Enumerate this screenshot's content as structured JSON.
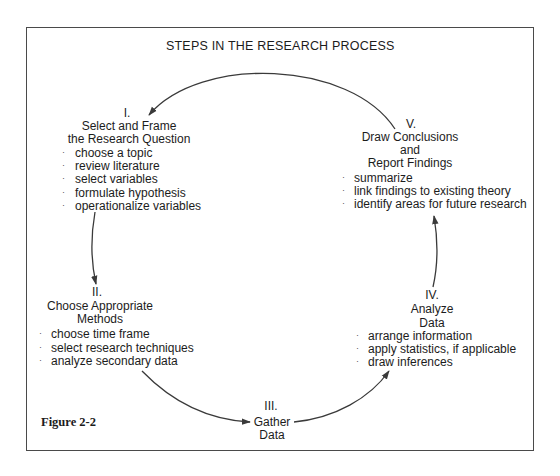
{
  "title": "STEPS IN THE RESEARCH PROCESS",
  "figure_label": "Figure 2-2",
  "bullet_glyph": "·",
  "steps": [
    {
      "numeral": "I.",
      "heading": [
        "Select and Frame",
        "the Research Question"
      ],
      "items": [
        "choose a topic",
        "review literature",
        "select variables",
        "formulate hypothesis",
        "operationalize variables"
      ]
    },
    {
      "numeral": "II.",
      "heading": [
        "Choose Appropriate",
        "Methods"
      ],
      "items": [
        "choose time frame",
        "select research techniques",
        "analyze secondary data"
      ]
    },
    {
      "numeral": "III.",
      "heading": [
        "Gather",
        "Data"
      ],
      "items": []
    },
    {
      "numeral": "IV.",
      "heading": [
        "Analyze",
        "Data"
      ],
      "items": [
        "arrange information",
        "apply statistics, if applicable",
        "draw inferences"
      ]
    },
    {
      "numeral": "V.",
      "heading": [
        "Draw Conclusions",
        "and",
        "Report Findings"
      ],
      "items": [
        "summarize",
        "link findings to existing theory",
        "identify areas for future research"
      ]
    }
  ],
  "flow": [
    {
      "from": "I.",
      "to": "II."
    },
    {
      "from": "II.",
      "to": "III."
    },
    {
      "from": "III.",
      "to": "IV."
    },
    {
      "from": "IV.",
      "to": "V."
    },
    {
      "from": "V.",
      "to": "I."
    }
  ],
  "colors": {
    "line": "#3a3a3a",
    "frame": "#4a4a4a",
    "text": "#1c1c1c"
  }
}
